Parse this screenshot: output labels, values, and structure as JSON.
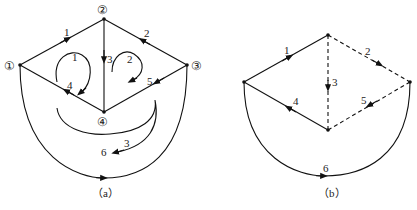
{
  "figure_a": {
    "caption": "（a）",
    "nodes": [
      {
        "id": "1",
        "label": "①"
      },
      {
        "id": "2",
        "label": "②"
      },
      {
        "id": "3",
        "label": "③"
      },
      {
        "id": "4",
        "label": "④"
      }
    ],
    "edges": [
      {
        "id": "1",
        "label": "1",
        "from": "1",
        "to": "2"
      },
      {
        "id": "2",
        "label": "2",
        "from": "3",
        "to": "2"
      },
      {
        "id": "3",
        "label": "3",
        "from": "2",
        "to": "4"
      },
      {
        "id": "4",
        "label": "4",
        "from": "4",
        "to": "1"
      },
      {
        "id": "5",
        "label": "5",
        "from": "3",
        "to": "4"
      },
      {
        "id": "6",
        "label": "6",
        "from": "1",
        "to": "3"
      }
    ],
    "loops": [
      {
        "id": "1",
        "label": "1",
        "direction": "clockwise"
      },
      {
        "id": "2",
        "label": "2",
        "direction": "clockwise"
      },
      {
        "id": "3",
        "label": "3",
        "direction": "clockwise"
      }
    ]
  },
  "figure_b": {
    "caption": "（b）",
    "edges": [
      {
        "id": "1",
        "label": "1",
        "style": "solid"
      },
      {
        "id": "2",
        "label": "2",
        "style": "dashed"
      },
      {
        "id": "3",
        "label": "3",
        "style": "dashed"
      },
      {
        "id": "4",
        "label": "4",
        "style": "solid"
      },
      {
        "id": "5",
        "label": "5",
        "style": "dashed"
      },
      {
        "id": "6",
        "label": "6",
        "style": "solid"
      }
    ]
  }
}
